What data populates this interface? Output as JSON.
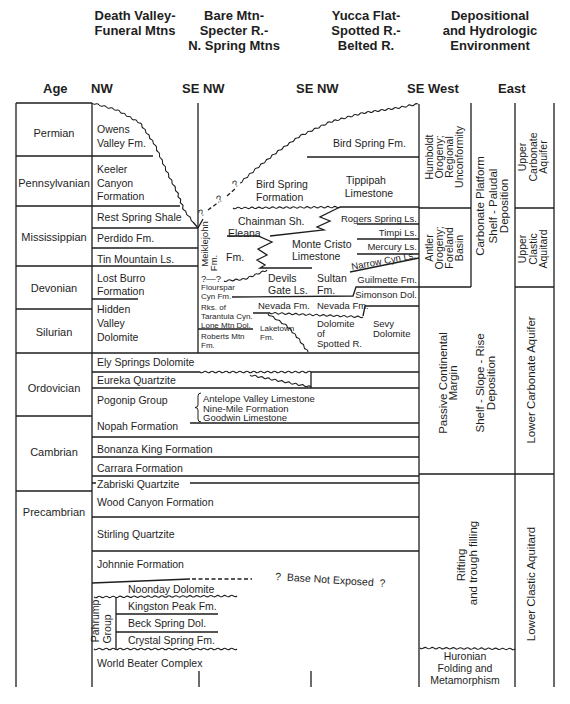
{
  "column_headers": {
    "death_valley": [
      "Death Valley-",
      "Funeral Mtns"
    ],
    "bare_mountain": [
      "Bare Mtn-",
      "Specter R.-",
      "N. Spring Mtns"
    ],
    "yucca_flat": [
      "Yucca Flat-",
      "Spotted R.-",
      "Belted R."
    ],
    "environment": [
      "Depositional",
      "and Hydrologic",
      "Environment"
    ]
  },
  "orientation": {
    "age": "Age",
    "nw": "NW",
    "se_nw_1": "SE NW",
    "se_nw_2": "SE NW",
    "se_west": "SE West",
    "east": "East"
  },
  "ages": [
    "Permian",
    "Pennsylvanian",
    "Mississippian",
    "Devonian",
    "Silurian",
    "Ordovician",
    "Cambrian",
    "Precambrian"
  ],
  "death_valley_units": {
    "owens_valley": [
      "Owens",
      "Valley Fm."
    ],
    "keeler_canyon": [
      "Keeler",
      "Canyon",
      "Formation"
    ],
    "rest_spring": "Rest Spring Shale",
    "perdido": "Perdido Fm.",
    "tin_mountain": "Tin Mountain Ls.",
    "lost_burro": [
      "Lost Burro",
      "Formation"
    ],
    "hidden_valley": [
      "Hidden",
      "Valley",
      "Dolomite"
    ]
  },
  "regional_units": {
    "ely_springs": "Ely Springs Dolomite",
    "eureka": "Eureka Quartzite",
    "pogonip": "Pogonip Group",
    "pogonip_members": [
      "Antelope Valley Limestone",
      "Nine-Mile Formation",
      "Goodwin Limestone"
    ],
    "nopah": "Nopah Formation",
    "bonanza_king": "Bonanza King Formation",
    "carrara": "Carrara Formation",
    "zabriski": "Zabriski Quartzite",
    "wood_canyon": "Wood Canyon Formation",
    "stirling": "Stirling Quartzite",
    "johnnie": "Johnnie Formation",
    "noonday": "Noonday Dolomite",
    "pahrump_group": [
      "Pahrump",
      "Group"
    ],
    "kingston_peak": "Kingston Peak Fm.",
    "beck_spring": "Beck Spring Dol.",
    "crystal_spring": "Crystal Spring Fm.",
    "world_beater": "World Beater Complex",
    "base_note": "?  Base Not Exposed  ?"
  },
  "bare_mountain_units": {
    "bird_spring": [
      "Bird Spring",
      "Formation"
    ],
    "chainman": "Chainman Sh.",
    "eleana": [
      "Eleana",
      "Fm."
    ],
    "meiklejohn": [
      "Meiklejohn",
      "Fm."
    ],
    "query_pair": "?—?",
    "flourspar": [
      "Flourspar",
      "Cyn Fm."
    ],
    "tarantula": [
      "Rks. of",
      "Tarantula Cyn.",
      "Lone Mtn Dol."
    ],
    "roberts_mtn": [
      "Roberts Mtn",
      "Fm."
    ],
    "laketown": [
      "Laketown",
      "Fm."
    ],
    "devils_gate": [
      "Devils",
      "Gate Ls."
    ],
    "nevada": "Nevada Fm."
  },
  "yucca_flat_units": {
    "bird_spring": "Bird Spring Fm.",
    "tippipah": [
      "Tippipah",
      "Limestone"
    ],
    "monte_cristo": [
      "Monte Cristo",
      "Limestone"
    ],
    "sultan": [
      "Sultan",
      "Fm."
    ],
    "rogers_spring": "Rogers Spring Ls.",
    "timpi": "Timpi Ls.",
    "mercury": "Mercury Ls.",
    "narrow_cyn": "Narrow Cyn Ls.",
    "guilmette": "Guilmette Fm.",
    "simonson": "Simonson Dol.",
    "nevada": "Nevada Fm.",
    "dolomite_spotted": [
      "Dolomite",
      "of",
      "Spotted R."
    ],
    "sevy": [
      "Sevy",
      "Dolomite"
    ]
  },
  "depositional_environment": {
    "humboldt": [
      "Humboldt",
      "Orogeny;",
      "Regional",
      "Unconformity"
    ],
    "antler": [
      "Antler",
      "Orogeny;",
      "Foreland",
      "Basin"
    ],
    "carbonate_platform": [
      "Carbonate Platform",
      "Shelf - Paludal",
      "Deposition"
    ],
    "passive_margin": [
      "Passive Continental",
      "Margin"
    ],
    "shelf_slope_rise": [
      "Shelf - Slope - Rise",
      "Deposition"
    ],
    "rifting": [
      "Rifting",
      "and trough filling"
    ],
    "huronian": [
      "Huronian",
      "Folding and",
      "Metamorphism"
    ]
  },
  "hydrologic_units": {
    "upper_carbonate": [
      "Upper",
      "Carbonate",
      "Aquifer"
    ],
    "upper_clastic": [
      "Upper",
      "Clastic",
      "Aquitard"
    ],
    "lower_carbonate": "Lower Carbonate Aquifer",
    "lower_clastic": "Lower Clastic Aquitard"
  },
  "symbols": {
    "query": "?"
  }
}
